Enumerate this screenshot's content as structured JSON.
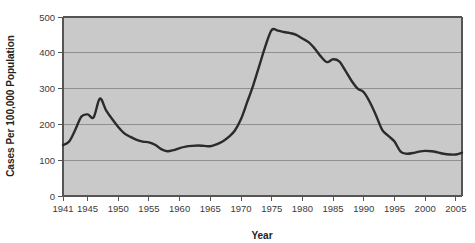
{
  "chart_data": {
    "type": "line",
    "title": "",
    "xlabel": "Year",
    "ylabel": "Cases Per 100,000 Population",
    "xlim": [
      1941,
      2006
    ],
    "ylim": [
      0,
      500
    ],
    "grid": true,
    "legend": null,
    "y_ticks": [
      0,
      100,
      200,
      300,
      400,
      500
    ],
    "y_tick_labels": [
      "0",
      "100",
      "200",
      "300",
      "400",
      "500"
    ],
    "x_ticks": [
      1941,
      1945,
      1950,
      1955,
      1960,
      1965,
      1970,
      1975,
      1980,
      1985,
      1990,
      1995,
      2000,
      2005
    ],
    "x_tick_labels": [
      "1941",
      "1945",
      "1950",
      "1955",
      "1960",
      "1965",
      "1970",
      "1975",
      "1980",
      "1985",
      "1990",
      "1995",
      "2000",
      "2005"
    ],
    "series": [
      {
        "name": "Cases Per 100,000 Population",
        "color": "#2b2b2b",
        "x": [
          1941,
          1942,
          1943,
          1944,
          1945,
          1946,
          1947,
          1948,
          1949,
          1950,
          1951,
          1952,
          1953,
          1954,
          1955,
          1956,
          1957,
          1958,
          1959,
          1960,
          1961,
          1962,
          1963,
          1964,
          1965,
          1966,
          1967,
          1968,
          1969,
          1970,
          1971,
          1972,
          1973,
          1974,
          1975,
          1976,
          1977,
          1978,
          1979,
          1980,
          1981,
          1982,
          1983,
          1984,
          1985,
          1986,
          1987,
          1988,
          1989,
          1990,
          1991,
          1992,
          1993,
          1994,
          1995,
          1996,
          1997,
          1998,
          1999,
          2000,
          2001,
          2002,
          2003,
          2004,
          2005,
          2006
        ],
        "y": [
          142,
          152,
          185,
          222,
          228,
          220,
          272,
          240,
          215,
          193,
          175,
          165,
          157,
          152,
          150,
          143,
          131,
          125,
          128,
          134,
          138,
          140,
          141,
          140,
          139,
          144,
          152,
          165,
          183,
          215,
          262,
          310,
          365,
          420,
          464,
          462,
          458,
          455,
          450,
          440,
          430,
          412,
          390,
          374,
          382,
          376,
          350,
          322,
          300,
          290,
          262,
          225,
          185,
          168,
          152,
          124,
          118,
          120,
          124,
          126,
          125,
          122,
          118,
          116,
          116,
          121
        ]
      }
    ],
    "annotations": []
  },
  "figure": {
    "background_color": "#ffffff",
    "plot_background_color": "#c9c9c9",
    "grid_color": "#8f8f8f",
    "axis_color": "#555555",
    "line_color": "#2b2b2b"
  }
}
